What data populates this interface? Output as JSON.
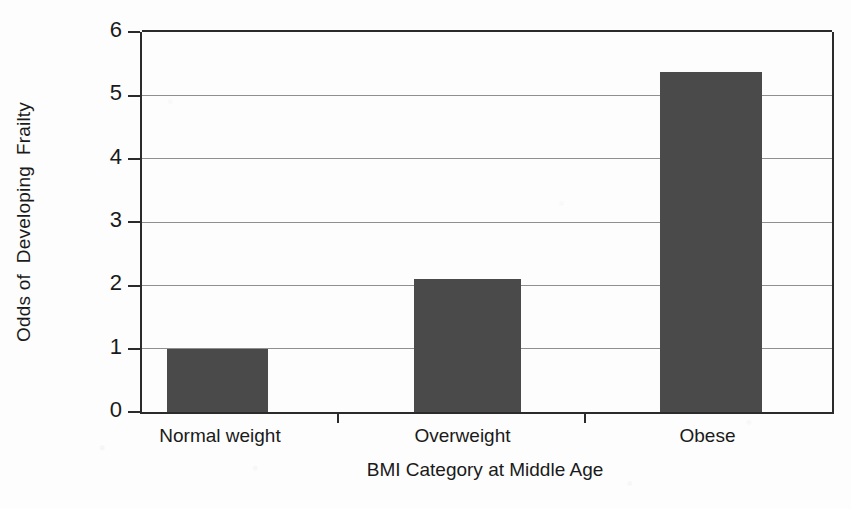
{
  "chart_data": {
    "type": "bar",
    "title": "",
    "xlabel": "BMI Category at Middle Age",
    "ylabel": "Odds of  Developing  Frailty",
    "categories": [
      "Normal weight",
      "Overweight",
      "Obese"
    ],
    "values": [
      1.0,
      2.1,
      5.37
    ],
    "series": [
      {
        "name": "Odds of Developing Frailty",
        "values": [
          1.0,
          2.1,
          5.37
        ]
      }
    ],
    "ylim": [
      0,
      6
    ],
    "yticks": [
      0,
      1,
      2,
      3,
      4,
      5,
      6
    ],
    "ytick_labels": [
      "0",
      "1",
      "2",
      "3",
      "4",
      "5",
      "6"
    ],
    "grid": "horizontal",
    "legend": "none",
    "bar_color": "#4a4a4a",
    "axis_color": "#2b2b2b",
    "gridline_color": "#8f8f8f",
    "background_color": "#fdfdfd"
  },
  "axis": {
    "y_title": "Odds of  Developing  Frailty",
    "x_title": "BMI Category at Middle Age",
    "y_labels": {
      "t0": "0",
      "t1": "1",
      "t2": "2",
      "t3": "3",
      "t4": "4",
      "t5": "5",
      "t6": "6"
    },
    "x_labels": {
      "c0": "Normal weight",
      "c1": "Overweight",
      "c2": "Obese"
    }
  }
}
